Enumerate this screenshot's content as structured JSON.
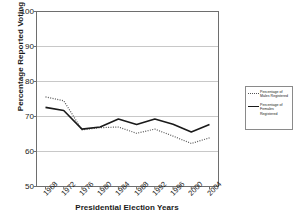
{
  "chart_data": {
    "type": "line",
    "title": "",
    "xlabel": "Presidential Election Years",
    "ylabel": "Percentage Reported Voting",
    "categories": [
      "1968",
      "1972",
      "1976",
      "1980",
      "1984",
      "1988",
      "1992",
      "1996",
      "2000",
      "2004"
    ],
    "ylim": [
      50,
      100
    ],
    "yticks": [
      50,
      60,
      70,
      80,
      90,
      100
    ],
    "grid": true,
    "legend_position": "right",
    "series": [
      {
        "name": "Percentage of Males Registered",
        "style": "dotted",
        "color": "#555555",
        "values": [
          75.6,
          74.5,
          66.2,
          66.8,
          67.0,
          65.2,
          66.4,
          64.4,
          62.3,
          63.9
        ]
      },
      {
        "name": "Percentage of Females Registered",
        "style": "solid",
        "color": "#1a1a1a",
        "values": [
          72.6,
          71.7,
          66.4,
          67.0,
          69.3,
          67.7,
          69.3,
          67.8,
          65.6,
          67.7
        ]
      }
    ]
  },
  "legend": {
    "entries": [
      {
        "label": "Percentage of Males Registered"
      },
      {
        "label": "Percentage of Females Registered"
      }
    ]
  },
  "axes": {
    "y_title": "Percentage Reported Voting",
    "x_title": "Presidential Election Years"
  }
}
